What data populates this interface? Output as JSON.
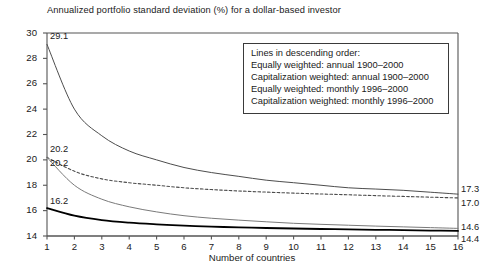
{
  "chart_data": {
    "type": "line",
    "title": "Annualized portfolio standard deviation (%) for a dollar-based investor",
    "xlabel": "Number of countries",
    "ylabel": "",
    "xlim": [
      1,
      16
    ],
    "ylim": [
      14,
      30
    ],
    "grid": false,
    "legend_position": "inside-top-right",
    "legend_title": "Lines in descending order:",
    "x": [
      1,
      2,
      3,
      4,
      5,
      6,
      7,
      8,
      9,
      10,
      11,
      12,
      13,
      14,
      15,
      16
    ],
    "xticks": [
      "1",
      "2",
      "3",
      "4",
      "5",
      "6",
      "7",
      "8",
      "9",
      "10",
      "11",
      "12",
      "13",
      "14",
      "15",
      "16"
    ],
    "yticks": [
      "14",
      "16",
      "18",
      "20",
      "22",
      "24",
      "26",
      "28",
      "30"
    ],
    "series": [
      {
        "name": "Equally weighted: annual 1900–2000",
        "style": "solid",
        "color": "#4d4d4d",
        "width": 1.0,
        "start_label": "29.1",
        "end_label": "17.3",
        "values": [
          29.1,
          24.0,
          21.9,
          20.7,
          20.0,
          19.4,
          19.0,
          18.7,
          18.4,
          18.2,
          18.0,
          17.8,
          17.7,
          17.6,
          17.45,
          17.3
        ]
      },
      {
        "name": "Capitalization weighted: annual 1900–2000",
        "style": "dashed",
        "color": "#4d4d4d",
        "width": 1.1,
        "start_label": "20.2",
        "end_label": "17.0",
        "values": [
          20.2,
          19.1,
          18.5,
          18.2,
          18.0,
          17.8,
          17.66,
          17.55,
          17.46,
          17.38,
          17.31,
          17.25,
          17.18,
          17.12,
          17.06,
          17.0
        ]
      },
      {
        "name": "Equally weighted: monthly 1996–2000",
        "style": "solid",
        "color": "#7a7a7a",
        "width": 1.0,
        "start_label": "20.2",
        "end_label": "14.6",
        "values": [
          20.2,
          18.0,
          16.9,
          16.3,
          15.9,
          15.6,
          15.4,
          15.25,
          15.12,
          15.0,
          14.92,
          14.85,
          14.78,
          14.72,
          14.66,
          14.6
        ]
      },
      {
        "name": "Capitalization weighted: monthly 1996–2000",
        "style": "solid",
        "color": "#000000",
        "width": 1.8,
        "start_label": "16.2",
        "end_label": "14.4",
        "values": [
          16.2,
          15.6,
          15.25,
          15.05,
          14.92,
          14.82,
          14.74,
          14.68,
          14.63,
          14.59,
          14.55,
          14.52,
          14.49,
          14.46,
          14.43,
          14.4
        ]
      }
    ]
  },
  "legend": {
    "lines": [
      "Lines in descending order:",
      "Equally weighted: annual 1900–2000",
      "Capitalization weighted: annual 1900–2000",
      "Equally weighted: monthly 1996–2000",
      "Capitalization weighted: monthly 1996–2000"
    ]
  }
}
